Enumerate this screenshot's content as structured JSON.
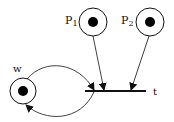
{
  "diagram": {
    "type": "petri-net",
    "places": [
      {
        "id": "p1",
        "label": "P",
        "subscript": "1",
        "tokens": 1,
        "cx": 93,
        "cy": 22,
        "r": 14
      },
      {
        "id": "p2",
        "label": "P",
        "subscript": "2",
        "tokens": 1,
        "cx": 150,
        "cy": 22,
        "r": 14
      },
      {
        "id": "w",
        "label": "w",
        "tokens": 1,
        "cx": 23,
        "cy": 91,
        "r": 13
      }
    ],
    "transitions": [
      {
        "id": "t",
        "label": "t",
        "x1": 85,
        "x2": 146,
        "y": 91
      }
    ],
    "arcs": [
      {
        "from": "p1",
        "to": "t"
      },
      {
        "from": "p2",
        "to": "t"
      },
      {
        "from": "w",
        "to": "t"
      },
      {
        "from": "t",
        "to": "w"
      }
    ],
    "colors": {
      "stroke": "#111111",
      "token": "#000000",
      "background": "#ffffff"
    }
  }
}
